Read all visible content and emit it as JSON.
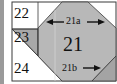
{
  "diagram": {
    "type": "quilt-block-piecing",
    "colors": {
      "fill_gray": "#b4b4b4",
      "fill_white": "#ffffff",
      "stroke": "#3a3a3a",
      "left_strip": "#9a9a9a"
    },
    "pieces": [
      {
        "id": "22",
        "label": "22",
        "fill": "white"
      },
      {
        "id": "23",
        "label": "23",
        "fill": "gray"
      },
      {
        "id": "24",
        "label": "24",
        "fill": "white"
      },
      {
        "id": "21",
        "label": "21",
        "fill": "gray"
      }
    ],
    "annotations": [
      {
        "label": "21a",
        "arrows": "both-directions"
      },
      {
        "label": "21b",
        "arrows": "right"
      }
    ]
  }
}
